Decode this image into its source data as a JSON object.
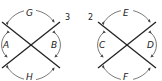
{
  "figures": [
    {
      "id": "left",
      "line_label": "3",
      "angles": {
        "top": "G",
        "bottom": "H",
        "left": "A",
        "right": "B"
      }
    },
    {
      "id": "right",
      "line_label": "2",
      "angles": {
        "top": "E",
        "bottom": "F",
        "left": "C",
        "right": "D"
      }
    }
  ],
  "colors": {
    "line": "#222222",
    "arc": "#555555",
    "background": "#ffffff"
  }
}
